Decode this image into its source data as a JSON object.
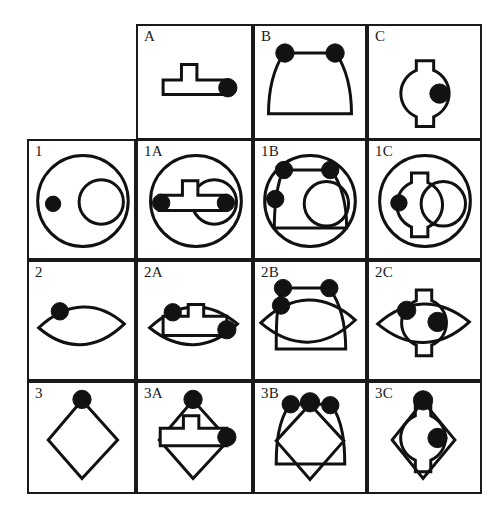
{
  "figure": {
    "kind": "visual-analogy-matrix",
    "title": "",
    "grid": {
      "rows": 4,
      "cols": 4
    },
    "ink_color": "#111111",
    "dot_color": "#121212",
    "background_color": "#ffffff",
    "border_color": "#1a1a1a"
  },
  "column_headers": [
    "",
    "A",
    "B",
    "C"
  ],
  "row_headers": [
    "",
    "1",
    "2",
    "3"
  ],
  "cells": [
    {
      "id": "r0c0",
      "label": "",
      "blank": true,
      "shapes": []
    },
    {
      "id": "r0c1",
      "label": "A",
      "blank": false,
      "shapes": [
        "tee-bar"
      ],
      "dots": 1
    },
    {
      "id": "r0c2",
      "label": "B",
      "blank": false,
      "shapes": [
        "dome-bucket"
      ],
      "dots": 2
    },
    {
      "id": "r0c3",
      "label": "C",
      "blank": false,
      "shapes": [
        "tabbed-circle"
      ],
      "dots": 1
    },
    {
      "id": "r1c0",
      "label": "1",
      "blank": false,
      "shapes": [
        "big-circle",
        "small-circle"
      ],
      "dots": 1
    },
    {
      "id": "r1c1",
      "label": "1A",
      "blank": false,
      "shapes": [
        "big-circle",
        "small-circle",
        "tee-bar"
      ],
      "dots": 2
    },
    {
      "id": "r1c2",
      "label": "1B",
      "blank": false,
      "shapes": [
        "big-circle",
        "small-circle",
        "dome-bucket"
      ],
      "dots": 3
    },
    {
      "id": "r1c3",
      "label": "1C",
      "blank": false,
      "shapes": [
        "big-circle",
        "small-circle",
        "tabbed-circle"
      ],
      "dots": 1
    },
    {
      "id": "r2c0",
      "label": "2",
      "blank": false,
      "shapes": [
        "lens"
      ],
      "dots": 1
    },
    {
      "id": "r2c1",
      "label": "2A",
      "blank": false,
      "shapes": [
        "lens",
        "tee-bar"
      ],
      "dots": 2
    },
    {
      "id": "r2c2",
      "label": "2B",
      "blank": false,
      "shapes": [
        "lens",
        "dome-bucket"
      ],
      "dots": 3
    },
    {
      "id": "r2c3",
      "label": "2C",
      "blank": false,
      "shapes": [
        "lens",
        "tabbed-circle"
      ],
      "dots": 2
    },
    {
      "id": "r3c0",
      "label": "3",
      "blank": false,
      "shapes": [
        "diamond"
      ],
      "dots": 1
    },
    {
      "id": "r3c1",
      "label": "3A",
      "blank": false,
      "shapes": [
        "diamond",
        "tee-bar"
      ],
      "dots": 2
    },
    {
      "id": "r3c2",
      "label": "3B",
      "blank": false,
      "shapes": [
        "diamond",
        "dome-bucket"
      ],
      "dots": 3
    },
    {
      "id": "r3c3",
      "label": "3C",
      "blank": false,
      "shapes": [
        "diamond",
        "tabbed-circle"
      ],
      "dots": 2
    }
  ]
}
